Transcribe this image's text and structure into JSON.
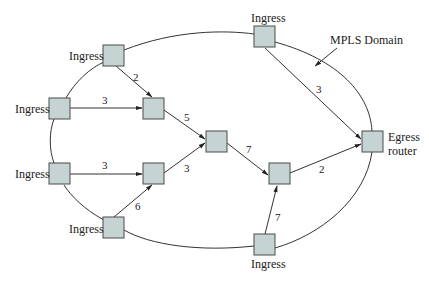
{
  "diagram": {
    "domain_label": "MPLS Domain",
    "colors": {
      "node_fill": "#c5d3d3",
      "node_stroke": "#4a4a4a",
      "line": "#333333",
      "background": "#ffffff"
    },
    "nodes": [
      {
        "id": "n_top_left",
        "label": "Ingress",
        "x": 103,
        "y": 45
      },
      {
        "id": "n_left_upper",
        "label": "Ingress",
        "x": 49,
        "y": 98
      },
      {
        "id": "n_mid_upper",
        "label": "",
        "x": 143,
        "y": 98
      },
      {
        "id": "n_center",
        "label": "",
        "x": 206,
        "y": 131
      },
      {
        "id": "n_left_lower",
        "label": "Ingress",
        "x": 49,
        "y": 163
      },
      {
        "id": "n_mid_lower",
        "label": "",
        "x": 143,
        "y": 163
      },
      {
        "id": "n_bottom_left",
        "label": "Ingress",
        "x": 103,
        "y": 217
      },
      {
        "id": "n_right_center",
        "label": "",
        "x": 269,
        "y": 163
      },
      {
        "id": "n_bottom_right",
        "label": "Ingress",
        "x": 254,
        "y": 234
      },
      {
        "id": "n_top_right",
        "label": "Ingress",
        "x": 254,
        "y": 26
      },
      {
        "id": "n_egress",
        "label": "Egress router",
        "label_line1": "Egress",
        "label_line2": "router",
        "x": 362,
        "y": 131
      }
    ],
    "edges": [
      {
        "from": "n_top_left",
        "to": "n_mid_upper",
        "weight": "2"
      },
      {
        "from": "n_left_upper",
        "to": "n_mid_upper",
        "weight": "3"
      },
      {
        "from": "n_mid_upper",
        "to": "n_center",
        "weight": "5"
      },
      {
        "from": "n_left_lower",
        "to": "n_mid_lower",
        "weight": "3"
      },
      {
        "from": "n_bottom_left",
        "to": "n_mid_lower",
        "weight": "6"
      },
      {
        "from": "n_mid_lower",
        "to": "n_center",
        "weight": "3"
      },
      {
        "from": "n_center",
        "to": "n_right_center",
        "weight": "7"
      },
      {
        "from": "n_bottom_right",
        "to": "n_right_center",
        "weight": "7"
      },
      {
        "from": "n_right_center",
        "to": "n_egress",
        "weight": "2"
      },
      {
        "from": "n_top_right",
        "to": "n_egress",
        "weight": "3"
      }
    ],
    "labels": {
      "ingress_top_left": "Ingress",
      "ingress_left_upper": "Ingress",
      "ingress_left_lower": "Ingress",
      "ingress_bottom_left": "Ingress",
      "ingress_top_right": "Ingress",
      "ingress_bottom_right": "Ingress",
      "egress_line1": "Egress",
      "egress_line2": "router",
      "mpls_domain": "MPLS Domain"
    },
    "weights": {
      "top_left_to_mid_upper": "2",
      "left_upper_to_mid_upper": "3",
      "mid_upper_to_center": "5",
      "left_lower_to_mid_lower": "3",
      "bottom_left_to_mid_lower": "6",
      "mid_lower_to_center": "3",
      "center_to_right_center": "7",
      "bottom_right_to_right_center": "7",
      "right_center_to_egress": "2",
      "top_right_to_egress": "3"
    }
  }
}
